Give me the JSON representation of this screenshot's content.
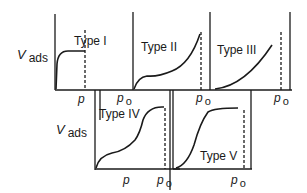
{
  "figure": {
    "y_axis_label": {
      "symbol": "V",
      "subscript": "ads"
    },
    "x_axis_label": "p",
    "saturation_label": {
      "symbol": "p",
      "subscript": "o"
    },
    "panels": [
      {
        "id": "type-1",
        "label": "Type I"
      },
      {
        "id": "type-2",
        "label": "Type II"
      },
      {
        "id": "type-3",
        "label": "Type III"
      },
      {
        "id": "type-4",
        "label": "Type IV"
      },
      {
        "id": "type-5",
        "label": "Type V"
      }
    ],
    "colors": {
      "line": "#1a1a1a",
      "background": "#ffffff"
    }
  }
}
